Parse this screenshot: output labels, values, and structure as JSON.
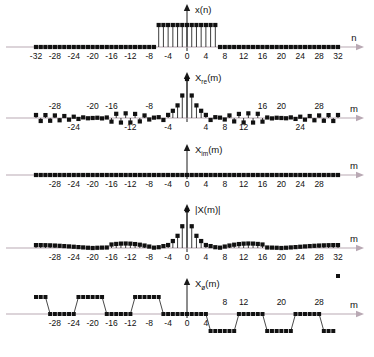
{
  "figure": {
    "title": "",
    "panels": [
      {
        "id": "x-n",
        "signal_label": "x(n)",
        "signal_label_main": "x",
        "signal_label_sub": "",
        "signal_label_tail": "(n)",
        "axis_name": "n",
        "xlabel": "n",
        "ticks": [
          -32,
          -28,
          -24,
          -20,
          -16,
          -12,
          -8,
          -4,
          0,
          4,
          8,
          12,
          16,
          20,
          24,
          28,
          32
        ],
        "tick_labels": [
          "-32",
          "-28",
          "-24",
          "-20",
          "-16",
          "-12",
          "-8",
          "-4",
          "0",
          "4",
          "8",
          "12",
          "16",
          "20",
          "24",
          "28",
          "32"
        ],
        "ticks_below": [
          -32,
          -28,
          -24,
          -20,
          -16,
          -12,
          -8,
          -4,
          0,
          4,
          8,
          12,
          16,
          20,
          24,
          28,
          32
        ],
        "ticks_above": []
      },
      {
        "id": "x-re-m",
        "signal_label": "Xre(m)",
        "signal_label_main": "X",
        "signal_label_sub": "re",
        "signal_label_tail": "(m)",
        "axis_name": "m",
        "xlabel": "m",
        "ticks_above": [
          -28,
          -20,
          -16,
          -8,
          16,
          20,
          28
        ],
        "tick_labels_above": [
          "-28",
          "-20",
          "-16",
          "-8",
          "16",
          "20",
          "28"
        ],
        "ticks_below": [
          -24,
          -12,
          -4,
          4,
          8,
          12,
          24
        ],
        "tick_labels_below": [
          "-24",
          "-12",
          "-4",
          "4",
          "8",
          "12",
          "24"
        ]
      },
      {
        "id": "x-im-m",
        "signal_label": "Xim(m)",
        "signal_label_main": "X",
        "signal_label_sub": "im",
        "signal_label_tail": "(m)",
        "axis_name": "m",
        "xlabel": "m",
        "ticks_below": [
          -28,
          -24,
          -20,
          -16,
          -12,
          -8,
          -4,
          0,
          4,
          8,
          12,
          16,
          20,
          24,
          28
        ],
        "tick_labels_below": [
          "-28",
          "-24",
          "-20",
          "-16",
          "-12",
          "-8",
          "-4",
          "0",
          "4",
          "8",
          "12",
          "16",
          "20",
          "24",
          "28"
        ],
        "ticks_above": []
      },
      {
        "id": "x-mag-m",
        "signal_label": "|X(m)|",
        "signal_label_main": "|X(m)|",
        "signal_label_sub": "",
        "signal_label_tail": "",
        "axis_name": "m",
        "xlabel": "m",
        "ticks_below": [
          -28,
          -24,
          -20,
          -16,
          -12,
          -8,
          -4,
          0,
          4,
          8,
          12,
          16,
          20,
          24,
          28,
          32
        ],
        "tick_labels_below": [
          "-28",
          "-24",
          "-20",
          "-16",
          "-12",
          "-8",
          "-4",
          "0",
          "4",
          "8",
          "12",
          "16",
          "20",
          "24",
          "28",
          "32"
        ],
        "ticks_above": []
      },
      {
        "id": "x-phase-m",
        "signal_label": "Xø(m)",
        "signal_label_main": "X",
        "signal_label_sub": "ø",
        "signal_label_tail": "(m)",
        "axis_name": "m",
        "xlabel": "m",
        "ticks_below": [
          -28,
          -24,
          -20,
          -16,
          -12,
          -8,
          -4,
          0,
          4
        ],
        "tick_labels_below": [
          "-28",
          "-24",
          "-20",
          "-16",
          "-12",
          "-8",
          "-4",
          "0",
          "4"
        ],
        "ticks_above": [
          8,
          12,
          20,
          28
        ],
        "tick_labels_above": [
          "8",
          "12",
          "20",
          "28"
        ]
      }
    ]
  },
  "style": {
    "axis_color": "#b9a9b4",
    "stem_color": "#1a1a1a",
    "marker_color": "#111111",
    "text_color": "#111111",
    "background": "#ffffff"
  },
  "chart_data": [
    {
      "type": "line",
      "id": "x-n",
      "title": "x(n)",
      "xlabel": "n",
      "ylabel": "x(n)",
      "description": "Rectangular pulse of 13 unit samples centered at n=0, zero elsewhere, over a 64-point record",
      "xlim": [
        -32,
        32
      ],
      "ylim": [
        0,
        1.15
      ],
      "grid": false,
      "legend": false,
      "pulse_half_width": 6,
      "pulse_amplitude": 1,
      "x": [
        -32,
        -31,
        -30,
        -29,
        -28,
        -27,
        -26,
        -25,
        -24,
        -23,
        -22,
        -21,
        -20,
        -19,
        -18,
        -17,
        -16,
        -15,
        -14,
        -13,
        -12,
        -11,
        -10,
        -9,
        -8,
        -7,
        -6,
        -5,
        -4,
        -3,
        -2,
        -1,
        0,
        1,
        2,
        3,
        4,
        5,
        6,
        7,
        8,
        9,
        10,
        11,
        12,
        13,
        14,
        15,
        16,
        17,
        18,
        19,
        20,
        21,
        22,
        23,
        24,
        25,
        26,
        27,
        28,
        29,
        30,
        31,
        32
      ],
      "values": [
        0,
        0,
        0,
        0,
        0,
        0,
        0,
        0,
        0,
        0,
        0,
        0,
        0,
        0,
        0,
        0,
        0,
        0,
        0,
        0,
        0,
        0,
        0,
        0,
        0,
        0,
        1,
        1,
        1,
        1,
        1,
        1,
        1,
        1,
        1,
        1,
        1,
        1,
        1,
        0,
        0,
        0,
        0,
        0,
        0,
        0,
        0,
        0,
        0,
        0,
        0,
        0,
        0,
        0,
        0,
        0,
        0,
        0,
        0,
        0,
        0,
        0,
        0,
        0,
        0
      ]
    },
    {
      "type": "line",
      "id": "x-re-m",
      "title": "Xre(m)",
      "xlabel": "m",
      "ylabel": "Xre(m)",
      "description": "Real part of the 64-point DFT: Dirichlet kernel sin(13*pi*m/64)/sin(pi*m/64), peak 13 at m=0",
      "xlim": [
        -32,
        32
      ],
      "ylim": [
        -3.5,
        13
      ],
      "grid": false,
      "legend": false,
      "N": 64,
      "K": 13,
      "peak": 13,
      "formula": "sin(pi*m*13/64)/sin(pi*m/64)",
      "x": [
        -32,
        -31,
        -30,
        -29,
        -28,
        -27,
        -26,
        -25,
        -24,
        -23,
        -22,
        -21,
        -20,
        -19,
        -18,
        -17,
        -16,
        -15,
        -14,
        -13,
        -12,
        -11,
        -10,
        -9,
        -8,
        -7,
        -6,
        -5,
        -4,
        -3,
        -2,
        -1,
        0,
        1,
        2,
        3,
        4,
        5,
        6,
        7,
        8,
        9,
        10,
        11,
        12,
        13,
        14,
        15,
        16,
        17,
        18,
        19,
        20,
        21,
        22,
        23,
        24,
        25,
        26,
        27,
        28,
        29,
        30,
        31,
        32
      ],
      "values": [
        1.0,
        -1.0,
        0.97,
        -0.92,
        0.85,
        -0.76,
        0.66,
        -0.55,
        0.43,
        -0.31,
        0.2,
        -0.09,
        0.0,
        0.08,
        -0.13,
        0.17,
        -1.21,
        1.4,
        -1.52,
        1.55,
        -1.5,
        1.36,
        -1.14,
        0.85,
        -0.5,
        0.12,
        0.27,
        -0.66,
        1.03,
        2.4,
        4.2,
        7.5,
        13.0,
        7.5,
        4.2,
        2.4,
        1.03,
        -0.66,
        0.27,
        0.12,
        -0.5,
        0.85,
        -1.14,
        1.36,
        -1.5,
        1.55,
        -1.52,
        1.4,
        -1.21,
        0.17,
        -0.13,
        0.08,
        0.0,
        -0.09,
        0.2,
        -0.31,
        0.43,
        -0.55,
        0.66,
        -0.76,
        0.85,
        -0.92,
        0.97,
        -1.0,
        1.0
      ]
    },
    {
      "type": "line",
      "id": "x-im-m",
      "title": "Xim(m)",
      "xlabel": "m",
      "ylabel": "Xim(m)",
      "description": "Imaginary part of the DFT is identically zero because the input sequence is real and even",
      "xlim": [
        -32,
        32
      ],
      "ylim": [
        -1,
        1
      ],
      "grid": false,
      "legend": false,
      "constant_value": 0,
      "x": [
        -32,
        -31,
        -30,
        -29,
        -28,
        -27,
        -26,
        -25,
        -24,
        -23,
        -22,
        -21,
        -20,
        -19,
        -18,
        -17,
        -16,
        -15,
        -14,
        -13,
        -12,
        -11,
        -10,
        -9,
        -8,
        -7,
        -6,
        -5,
        -4,
        -3,
        -2,
        -1,
        0,
        1,
        2,
        3,
        4,
        5,
        6,
        7,
        8,
        9,
        10,
        11,
        12,
        13,
        14,
        15,
        16,
        17,
        18,
        19,
        20,
        21,
        22,
        23,
        24,
        25,
        26,
        27,
        28,
        29,
        30,
        31,
        32
      ],
      "values": [
        0,
        0,
        0,
        0,
        0,
        0,
        0,
        0,
        0,
        0,
        0,
        0,
        0,
        0,
        0,
        0,
        0,
        0,
        0,
        0,
        0,
        0,
        0,
        0,
        0,
        0,
        0,
        0,
        0,
        0,
        0,
        0,
        0,
        0,
        0,
        0,
        0,
        0,
        0,
        0,
        0,
        0,
        0,
        0,
        0,
        0,
        0,
        0,
        0,
        0,
        0,
        0,
        0,
        0,
        0,
        0,
        0,
        0,
        0,
        0,
        0,
        0,
        0,
        0,
        0
      ]
    },
    {
      "type": "line",
      "id": "x-mag-m",
      "title": "|X(m)|",
      "xlabel": "m",
      "ylabel": "|X(m)|",
      "description": "Magnitude spectrum, the absolute value of the real part, peak 13 at m=0",
      "xlim": [
        -32,
        32
      ],
      "ylim": [
        0,
        13
      ],
      "grid": false,
      "legend": false,
      "peak": 13,
      "x": [
        -32,
        -31,
        -30,
        -29,
        -28,
        -27,
        -26,
        -25,
        -24,
        -23,
        -22,
        -21,
        -20,
        -19,
        -18,
        -17,
        -16,
        -15,
        -14,
        -13,
        -12,
        -11,
        -10,
        -9,
        -8,
        -7,
        -6,
        -5,
        -4,
        -3,
        -2,
        -1,
        0,
        1,
        2,
        3,
        4,
        5,
        6,
        7,
        8,
        9,
        10,
        11,
        12,
        13,
        14,
        15,
        16,
        17,
        18,
        19,
        20,
        21,
        22,
        23,
        24,
        25,
        26,
        27,
        28,
        29,
        30,
        31,
        32
      ],
      "values": [
        1.0,
        1.0,
        0.97,
        0.92,
        0.85,
        0.76,
        0.66,
        0.55,
        0.43,
        0.31,
        0.2,
        0.09,
        0.0,
        0.08,
        0.13,
        0.17,
        1.21,
        1.4,
        1.52,
        1.55,
        1.5,
        1.36,
        1.14,
        0.85,
        0.5,
        0.12,
        0.27,
        0.66,
        1.03,
        2.4,
        4.2,
        7.5,
        13.0,
        7.5,
        4.2,
        2.4,
        1.03,
        0.66,
        0.27,
        0.12,
        0.5,
        0.85,
        1.14,
        1.36,
        1.5,
        1.55,
        1.52,
        1.4,
        1.21,
        0.17,
        0.13,
        0.08,
        0.0,
        0.09,
        0.2,
        0.31,
        0.43,
        0.55,
        0.66,
        0.76,
        0.85,
        0.92,
        0.97,
        1.0,
        1.0
      ]
    },
    {
      "type": "line",
      "id": "x-phase-m",
      "title": "Xø(m)",
      "xlabel": "m",
      "ylabel": "Xø(m)",
      "description": "Phase spectrum alternating between 0 and plus/minus pi radians at each sign change of the real part",
      "xlim": [
        -32,
        32
      ],
      "ylim": [
        -3.5,
        3.5
      ],
      "grid": false,
      "legend": false,
      "levels": [
        0,
        3.14159,
        -3.14159
      ],
      "x": [
        -32,
        -31,
        -30,
        -29,
        -28,
        -27,
        -26,
        -25,
        -24,
        -23,
        -22,
        -21,
        -20,
        -19,
        -18,
        -17,
        -16,
        -15,
        -14,
        -13,
        -12,
        -11,
        -10,
        -9,
        -8,
        -7,
        -6,
        -5,
        -4,
        -3,
        -2,
        -1,
        0,
        1,
        2,
        3,
        4,
        5,
        6,
        7,
        8,
        9,
        10,
        11,
        12,
        13,
        14,
        15,
        16,
        17,
        18,
        19,
        20,
        21,
        22,
        23,
        24,
        25,
        26,
        27,
        28,
        29,
        30,
        31,
        32
      ],
      "values": [
        3.14159,
        3.14159,
        3.14159,
        0,
        0,
        0,
        0,
        0,
        0,
        3.14159,
        3.14159,
        3.14159,
        3.14159,
        3.14159,
        3.14159,
        0,
        0,
        0,
        0,
        0,
        0,
        3.14159,
        3.14159,
        3.14159,
        3.14159,
        3.14159,
        3.14159,
        0,
        0,
        0,
        0,
        0,
        0,
        0,
        0,
        0,
        0,
        -3.14159,
        -3.14159,
        -3.14159,
        -3.14159,
        -3.14159,
        -3.14159,
        0,
        0,
        0,
        0,
        0,
        0,
        -3.14159,
        -3.14159,
        -3.14159,
        -3.14159,
        -3.14159,
        -3.14159,
        0,
        0,
        0,
        0,
        0,
        0,
        -3.14159,
        -3.14159,
        -3.14159
      ]
    }
  ]
}
